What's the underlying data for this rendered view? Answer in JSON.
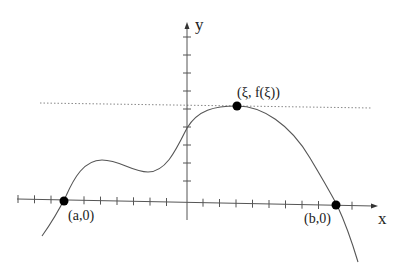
{
  "diagram": {
    "axes": {
      "x_label": "x",
      "y_label": "y"
    },
    "points": [
      {
        "id": "a",
        "label": "(a,0)"
      },
      {
        "id": "xi",
        "label": "(ξ, f(ξ))"
      },
      {
        "id": "b",
        "label": "(b,0)"
      }
    ],
    "horizontal_line": {
      "style": "dotted",
      "meaning": "tangent at maximum f(ξ)"
    },
    "colors": {
      "curve": "#555555",
      "axis": "#555555",
      "point": "#000000",
      "dotted": "#888888"
    }
  }
}
